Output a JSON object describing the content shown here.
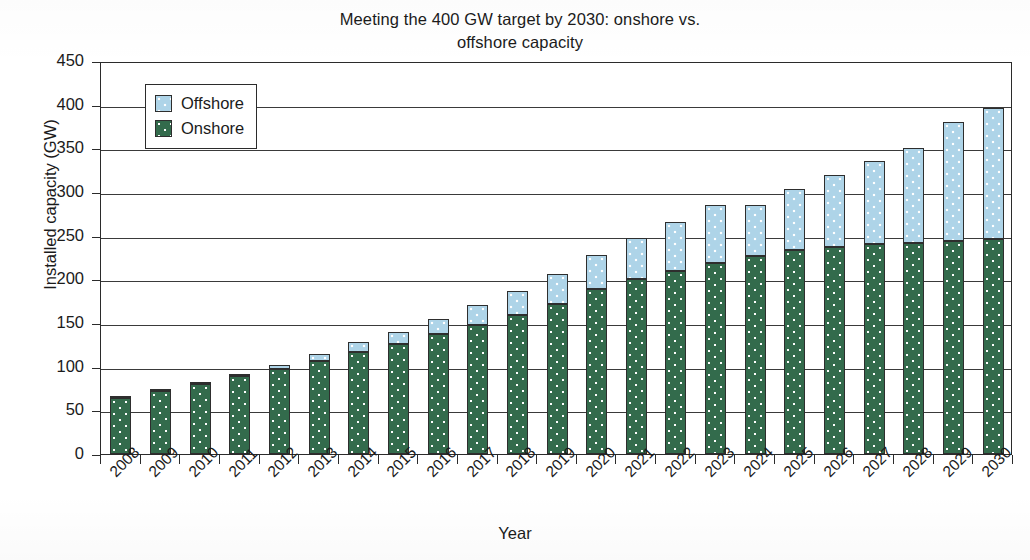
{
  "chart_data": {
    "type": "bar",
    "subtype": "stacked-column",
    "title": "Meeting the 400 GW target by 2030: onshore vs. offshore capacity",
    "title_lines": [
      "Meeting the 400 GW target by 2030: onshore vs.",
      "offshore capacity"
    ],
    "xlabel": "Year",
    "ylabel": "Installed capacity (GW)",
    "ylim": [
      0,
      450
    ],
    "ytick_step": 50,
    "yticks": [
      450,
      400,
      350,
      300,
      250,
      200,
      150,
      100,
      50,
      0
    ],
    "grid": "horizontal",
    "legend_position": "top-left-inside",
    "categories": [
      "2008",
      "2009",
      "2010",
      "2011",
      "2012",
      "2013",
      "2014",
      "2015",
      "2016",
      "2017",
      "2018",
      "2019",
      "2020",
      "2021",
      "2022",
      "2023",
      "2024",
      "2025",
      "2026",
      "2027",
      "2028",
      "2029",
      "2030"
    ],
    "series": [
      {
        "name": "Onshore",
        "color": "#336b4c",
        "values": [
          64,
          72,
          80,
          89,
          97,
          106,
          117,
          126,
          137,
          148,
          159,
          172,
          189,
          200,
          210,
          219,
          227,
          234,
          237,
          240,
          242,
          244,
          246
        ]
      },
      {
        "name": "Offshore",
        "color": "#aed4e8",
        "values": [
          1,
          2,
          3,
          3,
          5,
          8,
          11,
          14,
          18,
          23,
          28,
          34,
          39,
          47,
          56,
          66,
          58,
          69,
          83,
          95,
          108,
          136,
          150
        ]
      }
    ],
    "totals": [
      65,
      74,
      83,
      92,
      102,
      114,
      128,
      140,
      155,
      171,
      187,
      206,
      228,
      247,
      266,
      285,
      285,
      303,
      320,
      335,
      350,
      380,
      396
    ]
  },
  "legend": {
    "entries": [
      {
        "label": "Offshore",
        "swatch": "offshore-swatch"
      },
      {
        "label": "Onshore",
        "swatch": "onshore-swatch"
      }
    ]
  },
  "axes": {
    "y_title": "Installed capacity (GW)",
    "x_title": "Year"
  },
  "colors": {
    "onshore": "#336b4c",
    "offshore": "#aed4e8",
    "axis": "#2b2b2b",
    "grid": "#3a3a3a",
    "text": "#1b1b1b",
    "background": "#ffffff"
  }
}
